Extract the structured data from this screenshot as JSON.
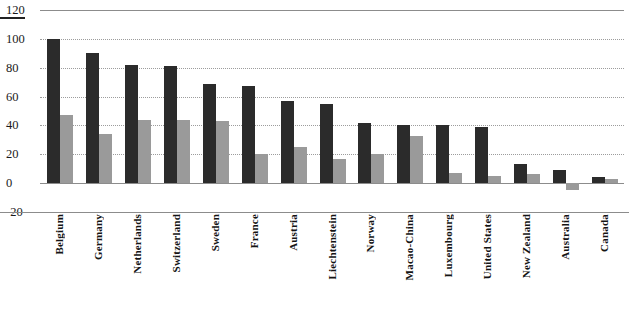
{
  "chart_data": {
    "type": "bar",
    "title": "",
    "subtitle": "",
    "xlabel": "",
    "ylabel": "",
    "ylim": [
      -20,
      120
    ],
    "yticks": [
      120,
      100,
      80,
      60,
      40,
      20,
      0,
      -20
    ],
    "grid": true,
    "legend_position": "none",
    "categories": [
      "Belgium",
      "Germany",
      "Netherlands",
      "Switzerland",
      "Sweden",
      "France",
      "Austria",
      "Liechtenstein",
      "Norway",
      "Macao-China",
      "Luxembourg",
      "United States",
      "New Zealand",
      "Australia",
      "Canada"
    ],
    "series": [
      {
        "name": "Series 1",
        "color": "#2b2b2b",
        "values": [
          100,
          90,
          82,
          81,
          69,
          67,
          57,
          55,
          42,
          40,
          40,
          39,
          13,
          9,
          4
        ]
      },
      {
        "name": "Series 2",
        "color": "#9a9a9a",
        "values": [
          47,
          34,
          44,
          44,
          43,
          20,
          25,
          17,
          20,
          33,
          7,
          5,
          6,
          -5,
          3
        ]
      }
    ]
  },
  "colors": {
    "series_a": "#2b2b2b",
    "series_b": "#9a9a9a",
    "gridline": "#9c9c9c",
    "axis": "#8c8c8c",
    "text": "#1a1a1a",
    "background": "#ffffff"
  }
}
